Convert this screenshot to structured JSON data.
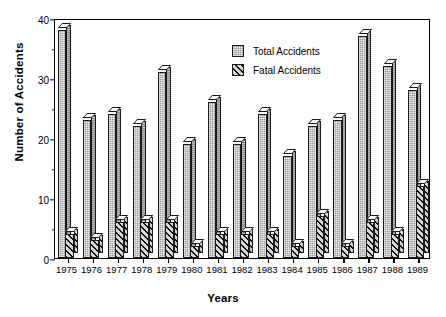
{
  "chart_data": {
    "type": "bar",
    "title": "",
    "xlabel": "Years",
    "ylabel": "Number of Accidents",
    "ylim": [
      0,
      40
    ],
    "yticks": [
      0,
      10,
      20,
      30,
      40
    ],
    "yticks_minor": [
      5,
      15,
      25,
      35
    ],
    "grid": false,
    "legend_position": "upper-center-right",
    "categories": [
      "1975",
      "1976",
      "1977",
      "1978",
      "1979",
      "1980",
      "1981",
      "1982",
      "1983",
      "1984",
      "1985",
      "1986",
      "1987",
      "1988",
      "1989"
    ],
    "series": [
      {
        "name": "Total Accidents",
        "values": [
          38,
          23,
          24,
          22,
          31,
          19,
          26,
          19,
          24,
          17,
          22,
          23,
          37,
          32,
          28
        ]
      },
      {
        "name": "Fatal Accidents",
        "values": [
          4,
          3,
          6,
          6,
          6,
          2,
          4,
          4,
          4,
          2,
          7,
          2,
          6,
          4,
          12
        ]
      }
    ]
  },
  "axes": {
    "y_title": "Number of Accidents",
    "x_title": "Years",
    "y_tick_labels": [
      "0",
      "10",
      "20",
      "30",
      "40"
    ]
  },
  "legend": {
    "items": [
      {
        "label": "Total Accidents",
        "pattern": "stippled-gray",
        "color": "#9a9a9a"
      },
      {
        "label": "Fatal Accidents",
        "pattern": "diagonal-hatch",
        "color": "#8e8e8e"
      }
    ]
  }
}
